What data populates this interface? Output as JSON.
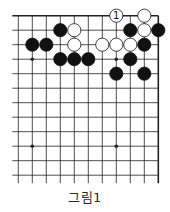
{
  "diagram": {
    "type": "go-board-partial",
    "caption": "그림1",
    "board": {
      "columns": 11,
      "rows": 12,
      "edges": [
        "top",
        "right"
      ],
      "open_sides": [
        "left",
        "bottom"
      ],
      "star_points": [
        {
          "col": 1,
          "row": 3
        },
        {
          "col": 7,
          "row": 3
        },
        {
          "col": 1,
          "row": 9
        },
        {
          "col": 7,
          "row": 9
        }
      ]
    },
    "stones": [
      {
        "color": "white",
        "col": 7,
        "row": 0,
        "label": "1"
      },
      {
        "color": "white",
        "col": 9,
        "row": 0
      },
      {
        "color": "black",
        "col": 3,
        "row": 1
      },
      {
        "color": "white",
        "col": 4,
        "row": 1
      },
      {
        "color": "black",
        "col": 8,
        "row": 1
      },
      {
        "color": "white",
        "col": 9,
        "row": 1
      },
      {
        "color": "black",
        "col": 10,
        "row": 1
      },
      {
        "color": "black",
        "col": 1,
        "row": 2
      },
      {
        "color": "black",
        "col": 2,
        "row": 2
      },
      {
        "color": "white",
        "col": 4,
        "row": 2
      },
      {
        "color": "white",
        "col": 6,
        "row": 2
      },
      {
        "color": "white",
        "col": 7,
        "row": 2
      },
      {
        "color": "white",
        "col": 8,
        "row": 2
      },
      {
        "color": "black",
        "col": 9,
        "row": 2
      },
      {
        "color": "black",
        "col": 3,
        "row": 3
      },
      {
        "color": "black",
        "col": 4,
        "row": 3
      },
      {
        "color": "black",
        "col": 5,
        "row": 3
      },
      {
        "color": "black",
        "col": 8,
        "row": 3
      },
      {
        "color": "black",
        "col": 7,
        "row": 4
      },
      {
        "color": "black",
        "col": 9,
        "row": 4
      }
    ],
    "colors": {
      "black_stone": "#111111",
      "white_stone": "#ffffff",
      "line": "#222222"
    }
  }
}
